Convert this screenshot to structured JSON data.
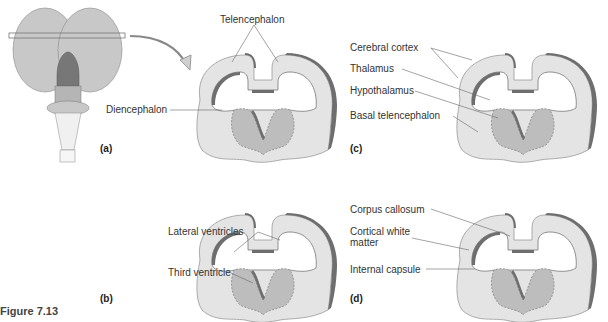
{
  "figure_caption": "Figure 7.13",
  "panels": {
    "a": {
      "label": "(a)"
    },
    "b": {
      "label": "(b)",
      "annotations": [
        "Lateral ventricles",
        "Third ventricle"
      ]
    },
    "c": {
      "label": "(c)",
      "annotations": [
        "Cerebral cortex",
        "Thalamus",
        "Hypothalamus",
        "Basal telencephalon"
      ]
    },
    "d": {
      "label": "(d)",
      "annotations": [
        "Corpus callosum",
        "Cortical white matter",
        "Internal capsule"
      ]
    }
  },
  "top_middle": {
    "annotations": [
      "Telencephalon",
      "Diencephalon"
    ]
  },
  "colors": {
    "light": "#e4e4e4",
    "mid": "#bdbdbd",
    "dark": "#6e6e6e",
    "line": "#666666"
  }
}
